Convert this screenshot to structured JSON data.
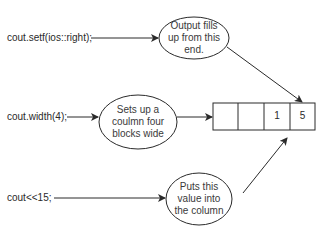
{
  "diagram": {
    "code_lines": [
      {
        "id": "setf",
        "text": "cout.setf(ios::right);"
      },
      {
        "id": "width",
        "text": "cout.width(4);"
      },
      {
        "id": "insert",
        "text": "cout<<15;"
      }
    ],
    "ellipses": [
      {
        "id": "output-fills",
        "text": "Output fills\nup from this\nend."
      },
      {
        "id": "sets-column",
        "text": "Sets up a\ncoulmn four\nblocks wide"
      },
      {
        "id": "puts-value",
        "text": "Puts this\nvalue into\nthe column"
      }
    ],
    "column_cells": [
      "",
      "",
      "1",
      "5"
    ],
    "colors": {
      "stroke": "#2a2a2a",
      "background": "#ffffff"
    }
  }
}
